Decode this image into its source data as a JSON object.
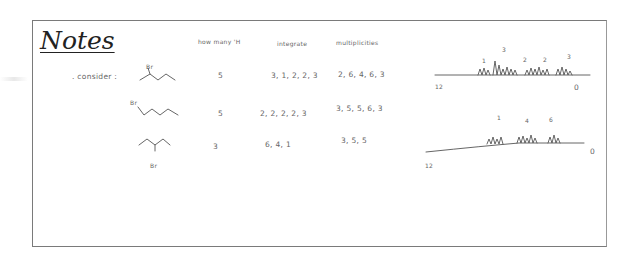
{
  "title": "Notes",
  "label_consider": ". consider :",
  "columns": {
    "how_many_h": "how many 'H",
    "integrate": "integrate",
    "multiplicities": "multiplicities"
  },
  "rows": [
    {
      "substituent": "Br",
      "how_many_h": "5",
      "integrate": "3, 1, 2, 2, 3",
      "multiplicities": "2, 6, 4, 6, 3"
    },
    {
      "substituent": "Br",
      "how_many_h": "5",
      "integrate": "2, 2, 2, 2, 3",
      "multiplicities": "3, 5, 5, 6, 3"
    },
    {
      "substituent": "Br",
      "how_many_h": "3",
      "integrate": "6, 4, 1",
      "multiplicities": "3, 5, 5"
    }
  ],
  "spectra": [
    {
      "peak_labels": [
        "1",
        "3",
        "2",
        "2",
        "3"
      ],
      "axis_left": "12",
      "axis_right": "0"
    },
    {
      "peak_labels": [
        "1",
        "4",
        "6"
      ],
      "axis_left": "12",
      "axis_right": "0"
    }
  ]
}
